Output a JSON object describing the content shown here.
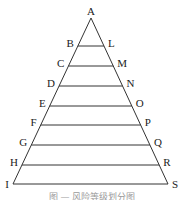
{
  "diagram": {
    "type": "layered-triangle",
    "apex": {
      "label": "A",
      "x": 91,
      "y": 18
    },
    "base": {
      "left_label": "I",
      "right_label": "S",
      "y": 184,
      "x_left": 13,
      "x_right": 168
    },
    "layers": [
      {
        "left": "B",
        "right": "L",
        "y": 46
      },
      {
        "left": "C",
        "right": "M",
        "y": 66
      },
      {
        "left": "D",
        "right": "N",
        "y": 86
      },
      {
        "left": "E",
        "right": "O",
        "y": 106
      },
      {
        "left": "F",
        "right": "P",
        "y": 125
      },
      {
        "left": "G",
        "right": "Q",
        "y": 145
      },
      {
        "left": "H",
        "right": "R",
        "y": 165
      }
    ],
    "line_color": "#333333"
  },
  "caption": "图 — 风险等级划分图"
}
